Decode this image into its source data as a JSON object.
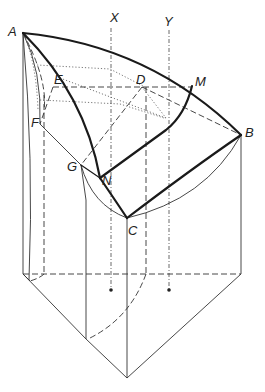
{
  "diagram": {
    "type": "geometric-solid-projection",
    "colors": {
      "ink": "#1a1a1a",
      "background": "#ffffff"
    },
    "labels": {
      "A": "A",
      "B": "B",
      "C": "C",
      "D": "D",
      "E": "E",
      "F": "F",
      "G": "G",
      "M": "M",
      "N": "N",
      "X": "X",
      "Y": "Y"
    },
    "points": {
      "A": [
        23,
        33
      ],
      "B": [
        241,
        135
      ],
      "C": [
        127,
        218
      ],
      "D": [
        142,
        87
      ],
      "E": [
        53,
        87
      ],
      "F": [
        40,
        124
      ],
      "G": [
        81,
        165
      ],
      "M": [
        192,
        86
      ],
      "N": [
        100,
        178
      ]
    },
    "axes": {
      "X": {
        "x": 111,
        "label_y": 22
      },
      "Y": {
        "x": 169,
        "label_y": 26
      }
    }
  }
}
